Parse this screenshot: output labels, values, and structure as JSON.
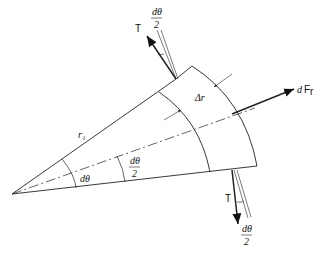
{
  "diagram": {
    "type": "free-body diagram of rotating ring element",
    "labels": {
      "tension_top": "T",
      "tension_bottom": "T",
      "half_angle_top_num": "dθ",
      "half_angle_top_den": "2",
      "half_angle_bottom_num": "dθ",
      "half_angle_bottom_den": "2",
      "half_angle_mid_num": "dθ",
      "half_angle_mid_den": "2",
      "angle": "dθ",
      "radius": "r₁",
      "thickness": "Δr",
      "radial_force_prefix": "d",
      "radial_force": "F",
      "radial_force_sub": "r"
    },
    "colors": {
      "line": "#222222",
      "background": "#ffffff"
    }
  }
}
